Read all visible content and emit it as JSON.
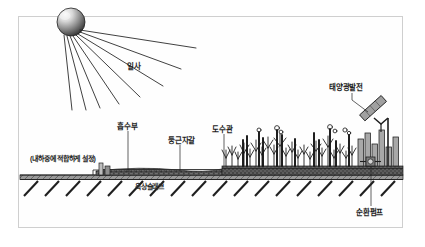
{
  "figure": {
    "domain_type": "technical-cross-section-diagram",
    "border_color": "#cfcfcf",
    "background_color": "#ffffff",
    "ink_color": "#1c1c1c"
  },
  "labels": {
    "insolation": "일사",
    "absorber": "흡수부",
    "round_gravel": "둥근자갈",
    "water_conduit": "도수관",
    "solar_pv": "태양광발전",
    "circulation_pump": "순환펌프",
    "rooftop_slab": "옥상슬래브",
    "load_note": "(내하중에 적합하게 설정)"
  },
  "elements": {
    "sun": "sun-icon",
    "rays": "sun-rays-icon",
    "ray_count": 8,
    "vegetation": "vegetation-icon",
    "gravel_bed": "gravel-layer-icon",
    "slab": "slab-layer-icon",
    "hatching": "structural-hatch-icon",
    "hatch_count": 18,
    "pv_panel": "solar-panel-icon",
    "pump": "pump-icon",
    "standpipe": "standpipe-icon"
  },
  "colors": {
    "line": "#1f1f1f",
    "slab_fill": "#8a8a8a",
    "gravel_fill": "#6e6e6e",
    "sun_light": "#f2f2f2",
    "sun_dark": "#3a3a3a",
    "panel_fill": "#9b9b9b"
  }
}
